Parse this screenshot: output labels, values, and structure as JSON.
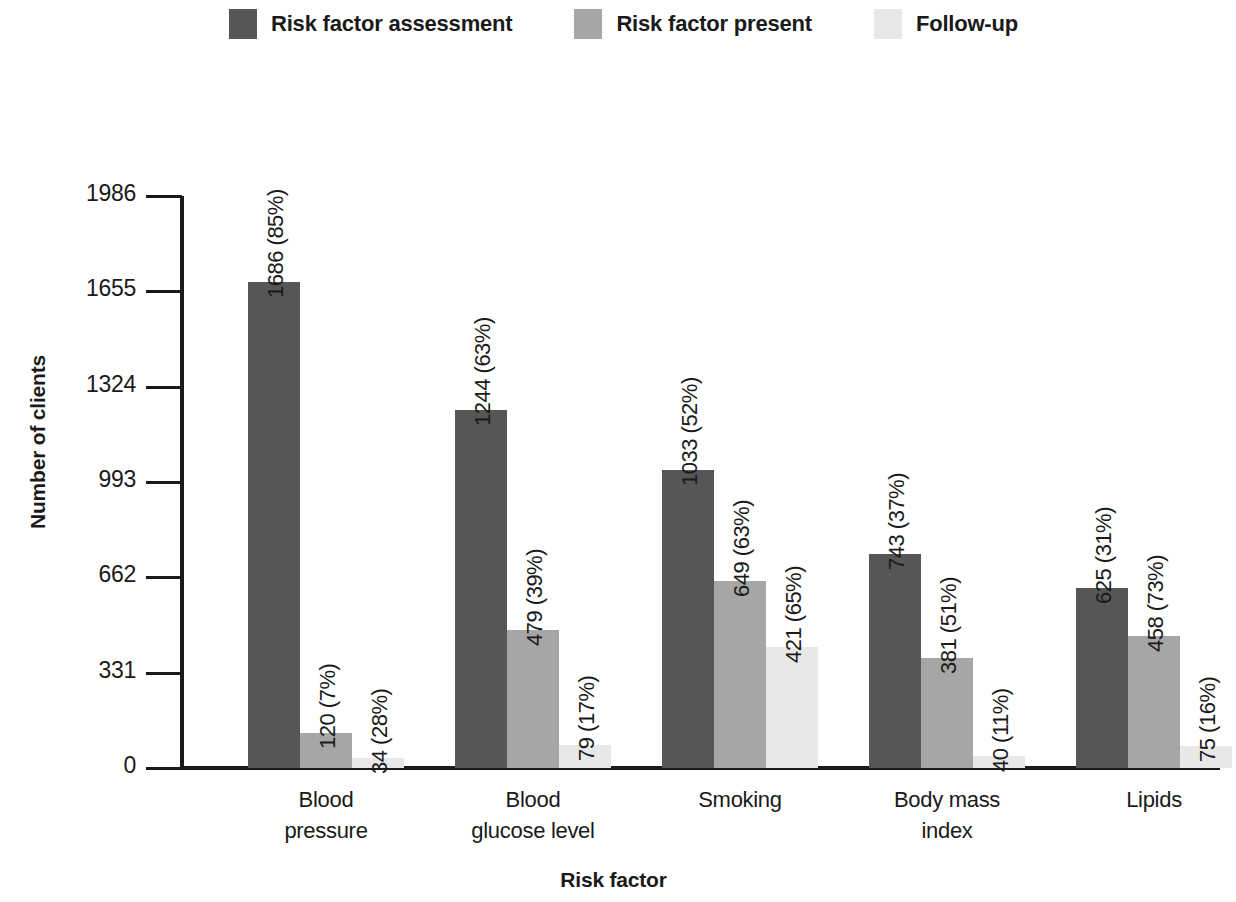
{
  "legend": {
    "items": [
      {
        "label": "Risk factor assessment",
        "color": "#565656"
      },
      {
        "label": "Risk factor present",
        "color": "#a6a6a6"
      },
      {
        "label": "Follow-up",
        "color": "#e8e8e8"
      }
    ]
  },
  "chart_data": {
    "type": "bar",
    "title": "",
    "xlabel": "Risk factor",
    "ylabel": "Number of clients",
    "ylim": [
      0,
      1986
    ],
    "grid": false,
    "legend_position": "top",
    "yticks": [
      0,
      331,
      662,
      993,
      1324,
      1655,
      1986
    ],
    "ytick_labels": [
      "0",
      "331",
      "662",
      "993",
      "1324",
      "1655",
      "1986"
    ],
    "categories": [
      "Blood\npressure",
      "Blood\nglucose level",
      "Smoking",
      "Body mass\nindex",
      "Lipids"
    ],
    "category_lines": [
      [
        "Blood",
        "pressure"
      ],
      [
        "Blood",
        "glucose level"
      ],
      [
        "Smoking",
        ""
      ],
      [
        "Body mass",
        "index"
      ],
      [
        "Lipids",
        ""
      ]
    ],
    "series": [
      {
        "name": "Risk factor assessment",
        "color": "#565656",
        "values": [
          1686,
          1244,
          1033,
          743,
          625
        ],
        "data_labels": [
          "1686 (85%)",
          "1244 (63%)",
          "1033 (52%)",
          "743 (37%)",
          "625 (31%)"
        ]
      },
      {
        "name": "Risk factor present",
        "color": "#a6a6a6",
        "values": [
          120,
          479,
          649,
          381,
          458
        ],
        "data_labels": [
          "120 (7%)",
          "479 (39%)",
          "649 (63%)",
          "381 (51%)",
          "458 (73%)"
        ]
      },
      {
        "name": "Follow-up",
        "color": "#e8e8e8",
        "values": [
          34,
          79,
          421,
          40,
          75
        ],
        "data_labels": [
          "34 (28%)",
          "79 (17%)",
          "421 (65%)",
          "40 (11%)",
          "75 (16%)"
        ]
      }
    ]
  }
}
